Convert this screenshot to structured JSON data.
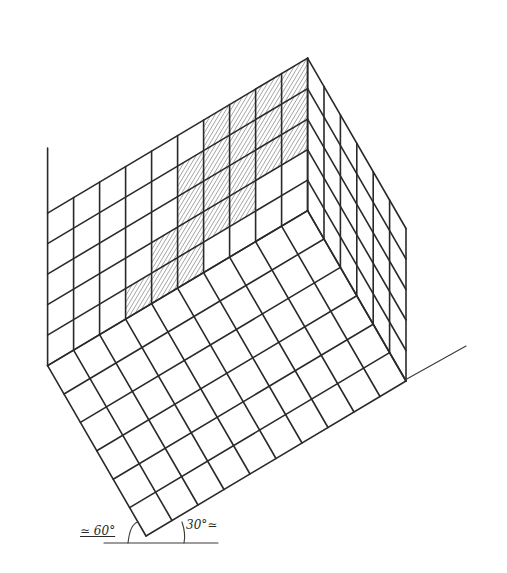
{
  "drawing": {
    "title": "Isometric grid sketch – two walls and floor",
    "stroke_color": "#2a2a2a",
    "hatch_color": "#6a6a6a",
    "background": "#ffffff"
  },
  "geometry": {
    "bottom_vertex": [
      146,
      536
    ],
    "dir_floor_right": [
      26,
      -15.5
    ],
    "dir_floor_left": [
      -16.4,
      -28.4
    ],
    "dir_up": [
      0,
      -30.5
    ],
    "floor_cells_right": 10,
    "floor_cells_left": 6,
    "wall_rows": 5,
    "left_wall_overshoot_top": 148,
    "baseline_right": {
      "from": [
        405,
        380
      ],
      "to": [
        466,
        346
      ]
    },
    "baseline_bottom": {
      "from": [
        104,
        543
      ],
      "to": [
        218,
        543
      ]
    },
    "shaded_cells": [
      [
        5,
        0
      ],
      [
        5,
        1
      ],
      [
        5,
        2
      ],
      [
        5,
        3
      ],
      [
        6,
        1
      ],
      [
        6,
        2
      ],
      [
        6,
        3
      ],
      [
        6,
        4
      ],
      [
        7,
        1
      ],
      [
        7,
        2
      ],
      [
        7,
        3
      ],
      [
        7,
        4
      ],
      [
        8,
        2
      ],
      [
        8,
        3
      ],
      [
        8,
        4
      ],
      [
        9,
        2
      ],
      [
        9,
        3
      ],
      [
        9,
        4
      ],
      [
        4,
        0
      ],
      [
        4,
        1
      ],
      [
        3,
        0
      ]
    ]
  },
  "annotations": {
    "angle_left": "≃ 60°",
    "angle_right": "30°≃"
  }
}
